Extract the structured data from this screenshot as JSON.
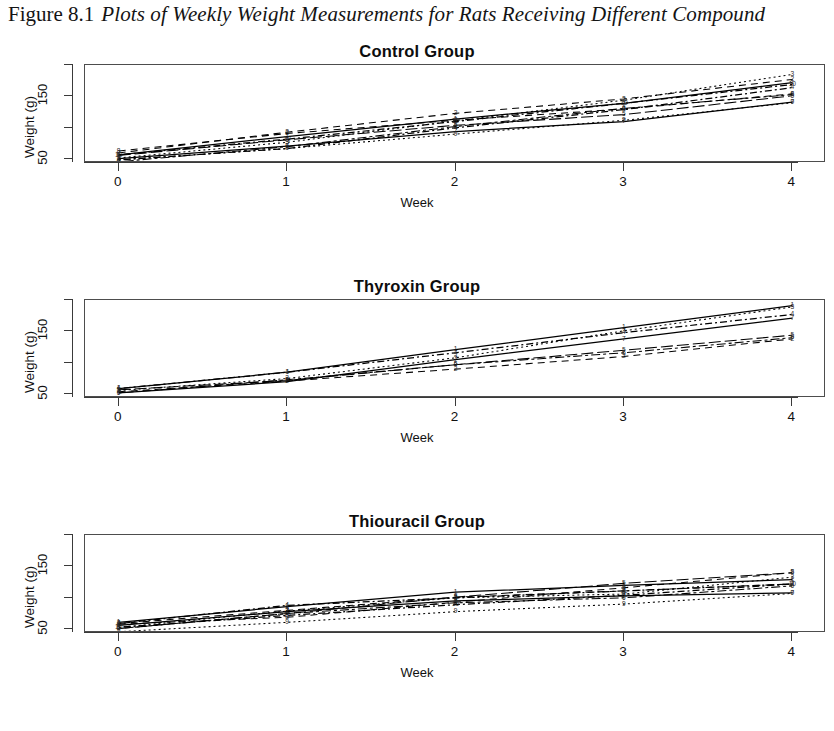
{
  "figure": {
    "number": "Figure 8.1",
    "caption": "Plots of Weekly Weight Measurements for Rats Receiving Different Compound",
    "caption_truncated": true
  },
  "axis": {
    "x_title": "Week",
    "y_title": "Weight (g)",
    "x_ticks": [
      "0",
      "1",
      "2",
      "3",
      "4"
    ],
    "x_values": [
      0,
      1,
      2,
      3,
      4
    ],
    "y_ticks": [
      "50",
      "",
      "150",
      ""
    ],
    "y_tick_values": [
      50,
      100,
      150,
      200
    ],
    "y_labeled": [
      "50",
      "150"
    ],
    "xlim": [
      -0.2,
      4.2
    ],
    "ylim": [
      44,
      200
    ],
    "grid": false,
    "legend": false
  },
  "panels": [
    {
      "id": "control",
      "title": "Control Group",
      "n_rats": 10
    },
    {
      "id": "thyroxin",
      "title": "Thyroxin Group",
      "n_rats": 7
    },
    {
      "id": "thiouracil",
      "title": "Thiouracil Group",
      "n_rats": 10
    }
  ],
  "chart_data": [
    {
      "type": "line",
      "title": "Control Group",
      "xlabel": "Week",
      "ylabel": "Weight (g)",
      "x": [
        0,
        1,
        2,
        3,
        4
      ],
      "xlim": [
        -0.2,
        4.2
      ],
      "ylim": [
        44,
        200
      ],
      "xticks": [
        0,
        1,
        2,
        3,
        4
      ],
      "yticks": [
        50,
        100,
        150,
        200
      ],
      "ytick_labels": [
        "50",
        "",
        "150",
        ""
      ],
      "grid": false,
      "legend": false,
      "series": [
        {
          "name": "1",
          "values": [
            57,
            86,
            114,
            139,
            172
          ]
        },
        {
          "name": "2",
          "values": [
            60,
            93,
            123,
            146,
            177
          ]
        },
        {
          "name": "3",
          "values": [
            52,
            77,
            111,
            144,
            185
          ]
        },
        {
          "name": "4",
          "values": [
            49,
            67,
            100,
            129,
            164
          ]
        },
        {
          "name": "5",
          "values": [
            56,
            81,
            104,
            121,
            151
          ]
        },
        {
          "name": "6",
          "values": [
            46,
            70,
            102,
            131,
            153
          ]
        },
        {
          "name": "7",
          "values": [
            51,
            71,
            94,
            110,
            141
          ]
        },
        {
          "name": "8",
          "values": [
            63,
            91,
            112,
            130,
            154
          ]
        },
        {
          "name": "9",
          "values": [
            49,
            67,
            90,
            112,
            140
          ]
        },
        {
          "name": "10",
          "values": [
            57,
            82,
            110,
            139,
            169
          ]
        }
      ]
    },
    {
      "type": "line",
      "title": "Thyroxin Group",
      "xlabel": "Week",
      "ylabel": "Weight (g)",
      "x": [
        0,
        1,
        2,
        3,
        4
      ],
      "xlim": [
        -0.2,
        4.2
      ],
      "ylim": [
        44,
        200
      ],
      "xticks": [
        0,
        1,
        2,
        3,
        4
      ],
      "yticks": [
        50,
        100,
        150,
        200
      ],
      "ytick_labels": [
        "50",
        "",
        "150",
        ""
      ],
      "grid": false,
      "legend": false,
      "series": [
        {
          "name": "1",
          "values": [
            59,
            85,
            121,
            156,
            191
          ]
        },
        {
          "name": "2",
          "values": [
            54,
            71,
            90,
            110,
            138
          ]
        },
        {
          "name": "3",
          "values": [
            56,
            75,
            108,
            151,
            189
          ]
        },
        {
          "name": "4",
          "values": [
            59,
            85,
            116,
            148,
            177
          ]
        },
        {
          "name": "5",
          "values": [
            57,
            72,
            97,
            120,
            144
          ]
        },
        {
          "name": "6",
          "values": [
            52,
            73,
            97,
            116,
            140
          ]
        },
        {
          "name": "7",
          "values": [
            52,
            70,
            105,
            138,
            171
          ]
        }
      ]
    },
    {
      "type": "line",
      "title": "Thiouracil Group",
      "xlabel": "Week",
      "ylabel": "Weight (g)",
      "x": [
        0,
        1,
        2,
        3,
        4
      ],
      "xlim": [
        -0.2,
        4.2
      ],
      "ylim": [
        44,
        200
      ],
      "xticks": [
        0,
        1,
        2,
        3,
        4
      ],
      "yticks": [
        50,
        100,
        150,
        200
      ],
      "ytick_labels": [
        "50",
        "",
        "150",
        ""
      ],
      "grid": false,
      "legend": false,
      "series": [
        {
          "name": "1",
          "values": [
            61,
            86,
            109,
            120,
            129
          ]
        },
        {
          "name": "2",
          "values": [
            59,
            80,
            101,
            111,
            122
          ]
        },
        {
          "name": "3",
          "values": [
            53,
            79,
            100,
            106,
            133
          ]
        },
        {
          "name": "4",
          "values": [
            59,
            88,
            100,
            111,
            122
          ]
        },
        {
          "name": "5",
          "values": [
            51,
            75,
            101,
            123,
            140
          ]
        },
        {
          "name": "6",
          "values": [
            51,
            75,
            92,
            100,
            119
          ]
        },
        {
          "name": "7",
          "values": [
            56,
            78,
            95,
            103,
            108
          ]
        },
        {
          "name": "8",
          "values": [
            58,
            69,
            93,
            116,
            140
          ]
        },
        {
          "name": "9",
          "values": [
            46,
            61,
            78,
            90,
            107
          ]
        },
        {
          "name": "10",
          "values": [
            53,
            72,
            89,
            104,
            122
          ]
        }
      ]
    }
  ]
}
